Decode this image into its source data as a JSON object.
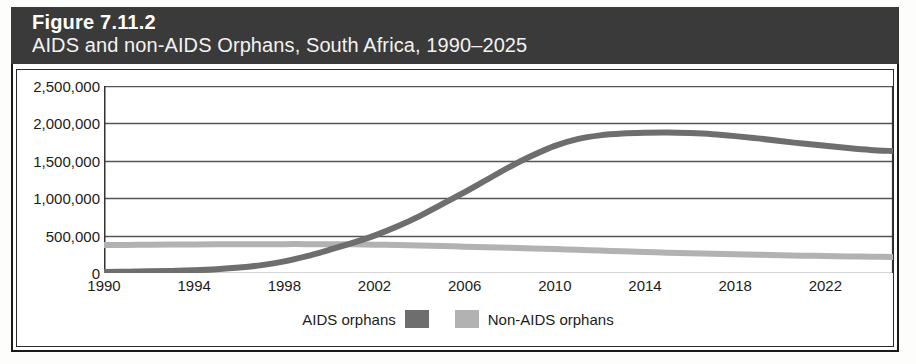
{
  "figure": {
    "number_label": "Figure 7.11.2",
    "subtitle": "AIDS and non-AIDS Orphans, South Africa, 1990–2025",
    "header_bg": "#3a3a3a",
    "header_text_color": "#ffffff"
  },
  "chart_data": {
    "type": "line",
    "title": "AIDS and non-AIDS Orphans, South Africa, 1990–2025",
    "xlabel": "",
    "ylabel": "",
    "xlim": [
      1990,
      2025
    ],
    "ylim": [
      0,
      2500000
    ],
    "grid": true,
    "legend_position": "bottom",
    "y_ticks": [
      0,
      500000,
      1000000,
      1500000,
      2000000,
      2500000
    ],
    "y_tick_labels": [
      "0",
      "500,000",
      "1,000,000",
      "1,500,000",
      "2,000,000",
      "2,500,000"
    ],
    "x_ticks": [
      1990,
      1994,
      1998,
      2002,
      2006,
      2010,
      2014,
      2018,
      2022
    ],
    "x_tick_labels": [
      "1990",
      "1994",
      "1998",
      "2002",
      "2006",
      "2010",
      "2014",
      "2018",
      "2022"
    ],
    "x_minor_ticks": [
      1990,
      1992,
      1994,
      1996,
      1998,
      2000,
      2002,
      2004,
      2006,
      2008,
      2010,
      2012,
      2014,
      2016,
      2018,
      2020,
      2022,
      2024
    ],
    "x": [
      1990,
      1991,
      1992,
      1993,
      1994,
      1995,
      1996,
      1997,
      1998,
      1999,
      2000,
      2001,
      2002,
      2003,
      2004,
      2005,
      2006,
      2007,
      2008,
      2009,
      2010,
      2011,
      2012,
      2013,
      2014,
      2015,
      2016,
      2017,
      2018,
      2019,
      2020,
      2021,
      2022,
      2023,
      2024,
      2025
    ],
    "series": [
      {
        "name": "AIDS orphans",
        "color": "#6e6e6e",
        "values": [
          15000,
          18000,
          22000,
          28000,
          36000,
          50000,
          72000,
          105000,
          155000,
          225000,
          310000,
          400000,
          500000,
          620000,
          760000,
          920000,
          1080000,
          1250000,
          1420000,
          1570000,
          1700000,
          1790000,
          1840000,
          1865000,
          1875000,
          1878000,
          1870000,
          1855000,
          1830000,
          1800000,
          1765000,
          1730000,
          1700000,
          1670000,
          1645000,
          1630000
        ]
      },
      {
        "name": "Non-AIDS orphans",
        "color": "#b2b2b2",
        "values": [
          375000,
          376000,
          378000,
          380000,
          382000,
          383000,
          384000,
          385000,
          386000,
          386000,
          385000,
          383000,
          379000,
          374000,
          368000,
          360000,
          352000,
          344000,
          336000,
          328000,
          320000,
          310000,
          300000,
          290000,
          280000,
          272000,
          264000,
          257000,
          250000,
          244000,
          238000,
          232000,
          227000,
          222000,
          218000,
          215000
        ]
      }
    ]
  },
  "legend": {
    "entries": [
      {
        "label": "AIDS orphans",
        "color": "#6e6e6e",
        "swatch_side": "right"
      },
      {
        "label": "Non-AIDS orphans",
        "color": "#b2b2b2",
        "swatch_side": "left"
      }
    ]
  },
  "colors": {
    "plot_border": "#2b2b2b",
    "gridline": "#555555",
    "axis": "#333333",
    "background": "#ffffff"
  }
}
